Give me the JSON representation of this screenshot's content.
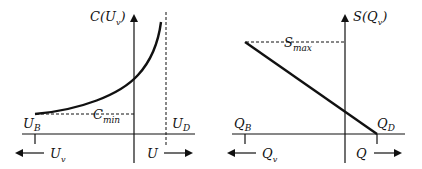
{
  "left_panel": {
    "y_axis_label_main": "C(U",
    "y_axis_label_sub": "v",
    "y_axis_label_close": ")",
    "cmin_main": "C",
    "cmin_sub": "min",
    "ub_main": "U",
    "ub_sub": "B",
    "ud_main": "U",
    "ud_sub": "D",
    "left_arrow_main": "U",
    "left_arrow_sub": "v",
    "right_arrow_label": "U"
  },
  "right_panel": {
    "y_axis_label_main": "S(Q",
    "y_axis_label_sub": "v",
    "y_axis_label_close": ")",
    "smax_main": "S",
    "smax_sub": "max",
    "qb_main": "Q",
    "qb_sub": "B",
    "qd_main": "Q",
    "qd_sub": "D",
    "left_arrow_main": "Q",
    "left_arrow_sub": "v",
    "right_arrow_label": "Q"
  },
  "colors": {
    "ink": "#111111",
    "background": "#ffffff"
  }
}
